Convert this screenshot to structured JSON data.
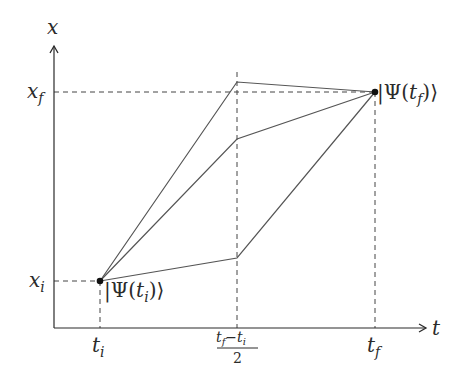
{
  "diagram": {
    "type": "path-integral-spacetime",
    "colors": {
      "axis": "#2b2b2b",
      "path": "#555555",
      "dash": "#444444",
      "point": "#111111",
      "background": "#ffffff"
    },
    "axes": {
      "y_label": "x",
      "x_label": "t"
    },
    "ticks": {
      "y": [
        {
          "main": "x",
          "sub": "f"
        },
        {
          "main": "x",
          "sub": "i"
        }
      ],
      "x": [
        {
          "main": "t",
          "sub": "i"
        },
        {
          "numerator_main1": "t",
          "numerator_sub1": "f",
          "minus": "−",
          "numerator_main2": "t",
          "numerator_sub2": "i",
          "denominator": "2"
        },
        {
          "main": "t",
          "sub": "f"
        }
      ]
    },
    "states": {
      "initial": {
        "bar": "|",
        "psi": "Ψ",
        "open": "(",
        "t": "t",
        "sub": "i",
        "close": ")",
        "ket": "⟩"
      },
      "final": {
        "bar": "|",
        "psi": "Ψ",
        "open": "(",
        "t": "t",
        "sub": "f",
        "close": ")",
        "ket": "⟩"
      }
    },
    "paths": [
      {
        "name": "upper-path",
        "points": [
          [
            100,
            281
          ],
          [
            237,
            82
          ],
          [
            375,
            92
          ]
        ]
      },
      {
        "name": "middle-path",
        "points": [
          [
            100,
            281
          ],
          [
            237,
            139
          ],
          [
            375,
            92
          ]
        ]
      },
      {
        "name": "lower-path",
        "points": [
          [
            100,
            281
          ],
          [
            237,
            258
          ],
          [
            375,
            92
          ]
        ]
      }
    ]
  }
}
